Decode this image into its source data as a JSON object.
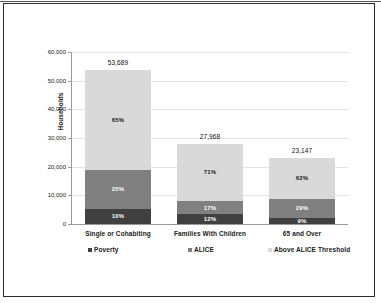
{
  "document": {
    "cropped_header_fragment": "",
    "border_color": "#2b2b2b"
  },
  "chart_data": {
    "type": "bar",
    "subtype": "stacked-bar-100-with-totals",
    "title": "",
    "xlabel": "",
    "ylabel": "Households",
    "ylim": [
      0,
      60000
    ],
    "ytick_values": [
      0,
      10000,
      20000,
      30000,
      40000,
      50000,
      60000
    ],
    "ytick_labels": [
      "0",
      "10,000",
      "20,000",
      "30,000",
      "40,000",
      "50,000",
      "60,000"
    ],
    "grid": true,
    "legend_position": "bottom",
    "categories": [
      "Single or Cohabiting",
      "Families With Children",
      "65 and Over"
    ],
    "totals": [
      53689,
      27968,
      23147
    ],
    "total_labels": [
      "53,689",
      "27,968",
      "23,147"
    ],
    "series": [
      {
        "name": "Poverty",
        "color": "#404040",
        "values": [
          5369,
          3356,
          2083
        ],
        "percent_labels": [
          "10%",
          "12%",
          "9%"
        ],
        "percents": [
          10,
          12,
          9
        ]
      },
      {
        "name": "ALICE",
        "color": "#808080",
        "values": [
          13422,
          4755,
          6713
        ],
        "percent_labels": [
          "25%",
          "17%",
          "29%"
        ],
        "percents": [
          25,
          17,
          29
        ]
      },
      {
        "name": "Above ALICE Threshold",
        "color": "#d9d9d9",
        "values": [
          34898,
          19857,
          14351
        ],
        "percent_labels": [
          "65%",
          "71%",
          "62%"
        ],
        "percents": [
          65,
          71,
          62
        ]
      }
    ],
    "legend": [
      {
        "label": "Poverty",
        "color": "#404040"
      },
      {
        "label": "ALICE",
        "color": "#808080"
      },
      {
        "label": "Above ALICE Threshold",
        "color": "#d9d9d9"
      }
    ]
  }
}
